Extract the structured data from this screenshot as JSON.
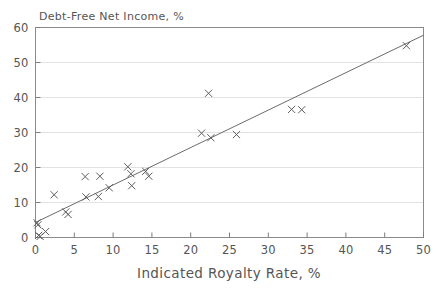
{
  "chart_data": {
    "type": "scatter",
    "title": "Debt-Free Net Income, %",
    "xlabel": "Indicated Royalty Rate, %",
    "ylabel": "Debt-Free Net Income, %",
    "xlim": [
      0,
      50
    ],
    "ylim": [
      0,
      60
    ],
    "xticks": [
      0,
      5,
      10,
      15,
      20,
      25,
      30,
      35,
      40,
      45,
      50
    ],
    "yticks": [
      0,
      10,
      20,
      30,
      40,
      50,
      60
    ],
    "grid": "horizontal",
    "legend": "none",
    "marker": "x",
    "series": [
      {
        "name": "observations",
        "points": [
          [
            0.2,
            4.2
          ],
          [
            0.3,
            3.6
          ],
          [
            0.4,
            0.6
          ],
          [
            0.6,
            0.3
          ],
          [
            1.3,
            1.7
          ],
          [
            2.4,
            12.2
          ],
          [
            3.9,
            7.3
          ],
          [
            4.2,
            6.6
          ],
          [
            6.4,
            17.4
          ],
          [
            6.5,
            11.6
          ],
          [
            8.1,
            11.7
          ],
          [
            8.3,
            17.5
          ],
          [
            9.5,
            14.2
          ],
          [
            11.9,
            20.2
          ],
          [
            12.3,
            18.2
          ],
          [
            12.4,
            14.8
          ],
          [
            14.2,
            18.9
          ],
          [
            14.6,
            17.5
          ],
          [
            21.4,
            29.8
          ],
          [
            22.3,
            41.2
          ],
          [
            22.6,
            28.5
          ],
          [
            25.9,
            29.4
          ],
          [
            33.0,
            36.6
          ],
          [
            34.3,
            36.5
          ],
          [
            47.8,
            54.8
          ]
        ]
      }
    ],
    "trendline": {
      "name": "linear fit",
      "x_start": 0,
      "y_start": 4.3,
      "x_end": 50,
      "y_end": 57.8
    }
  },
  "labels": {
    "yticks": [
      "0",
      "10",
      "20",
      "30",
      "40",
      "50",
      "60"
    ],
    "xticks": [
      "0",
      "5",
      "10",
      "15",
      "20",
      "25",
      "30",
      "35",
      "40",
      "45",
      "50"
    ],
    "title": "Debt-Free Net Income, %",
    "xaxis_title": "Indicated Royalty Rate, %"
  }
}
